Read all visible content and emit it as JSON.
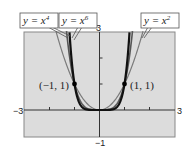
{
  "chart_data": {
    "type": "line",
    "title": "",
    "xlabel": "",
    "ylabel": "",
    "xlim": [
      -3,
      3
    ],
    "ylim": [
      -1,
      3
    ],
    "grid": false,
    "x_tick_labels": [
      "-3",
      "3"
    ],
    "y_tick_labels": [
      "3",
      "-1"
    ],
    "series": [
      {
        "name": "y = x^2",
        "label_base": "y = x",
        "exponent": "2",
        "function": "x^2",
        "color": "#7a7a7a",
        "width": 1.2
      },
      {
        "name": "y = x^4",
        "label_base": "y = x",
        "exponent": "4",
        "function": "x^4",
        "color": "#555555",
        "width": 1.6
      },
      {
        "name": "y = x^6",
        "label_base": "y = x",
        "exponent": "6",
        "function": "x^6",
        "color": "#111111",
        "width": 2.2
      }
    ],
    "annotations": [
      {
        "text": "(−1, 1)",
        "x": -1,
        "y": 1
      },
      {
        "text": "(1, 1)",
        "x": 1,
        "y": 1
      }
    ],
    "background": "#dcdcdc"
  },
  "labels": {
    "x_min": "−3",
    "x_max": "3",
    "y_max": "3",
    "y_min": "−1",
    "point_left": "(−1, 1)",
    "point_right": "(1, 1)",
    "legend_x4_base": "y = x",
    "legend_x4_exp": "4",
    "legend_x6_base": "y = x",
    "legend_x6_exp": "6",
    "legend_x2_base": "y = x",
    "legend_x2_exp": "2"
  }
}
